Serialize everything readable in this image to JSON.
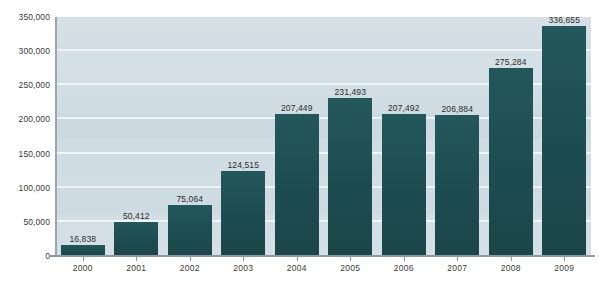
{
  "figure": {
    "title_remnant": "",
    "plot_background_color": "#cfdce3",
    "bar_color": "#1e4e52",
    "gridline_color": "#f2f7f9",
    "axis_color": "#8d9aa3"
  },
  "chart_data": {
    "type": "bar",
    "title": "",
    "xlabel": "",
    "ylabel": "",
    "categories": [
      "2000",
      "2001",
      "2002",
      "2003",
      "2004",
      "2005",
      "2006",
      "2007",
      "2008",
      "2009"
    ],
    "values": [
      16838,
      50412,
      75064,
      124515,
      207449,
      231493,
      207492,
      206884,
      275284,
      336655
    ],
    "value_labels": [
      "16,838",
      "50,412",
      "75,064",
      "124,515",
      "207,449",
      "231,493",
      "207,492",
      "206,884",
      "275,284",
      "336,655"
    ],
    "ylim": [
      0,
      350000
    ],
    "ytick_values": [
      0,
      50000,
      100000,
      150000,
      200000,
      250000,
      300000,
      350000
    ],
    "ytick_labels": [
      "0",
      "50,000",
      "100,000",
      "150,000",
      "200,000",
      "250,000",
      "300,000",
      "350,000"
    ],
    "grid": true,
    "legend": null,
    "series": [
      {
        "name": "",
        "values": [
          16838,
          50412,
          75064,
          124515,
          207449,
          231493,
          207492,
          206884,
          275284,
          336655
        ]
      }
    ]
  }
}
